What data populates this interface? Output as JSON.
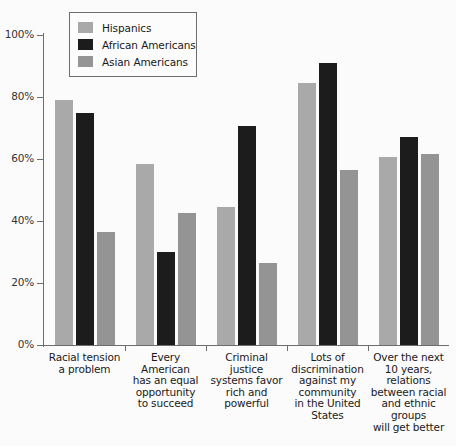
{
  "chart_data": {
    "type": "bar",
    "title": "",
    "xlabel": "",
    "ylabel": "",
    "ylim": [
      0,
      100
    ],
    "ytick_labels": [
      "0%",
      "20%",
      "40%",
      "60%",
      "80%",
      "100%"
    ],
    "ytick_values": [
      0,
      20,
      40,
      60,
      80,
      100
    ],
    "grid": false,
    "legend_position": "top-left-inside",
    "categories": [
      "Racial tension a problem",
      "Every American has an equal opportunity to succeed",
      "Criminal justice systems favor rich and powerful",
      "Lots of discrimination against my community in the United States",
      "Over the next 10 years, relations between racial and ethnic groups will get better"
    ],
    "category_lines": [
      [
        "Racial tension",
        "a problem"
      ],
      [
        "Every American",
        "has an equal",
        "opportunity",
        "to succeed"
      ],
      [
        "Criminal",
        "justice",
        "systems favor",
        "rich and",
        "powerful"
      ],
      [
        "Lots of",
        "discrimination",
        "against my",
        "community",
        "in the United",
        "States"
      ],
      [
        "Over the next",
        "10 years,",
        "relations",
        "between racial",
        "and ethnic",
        "groups",
        "will get better"
      ]
    ],
    "series": [
      {
        "name": "Hispanics",
        "color": "#a9a9a9",
        "values": [
          79,
          58.5,
          44.5,
          84.5,
          60.5
        ]
      },
      {
        "name": "African Americans",
        "color": "#1c1c1c",
        "values": [
          75,
          30,
          70.5,
          91,
          67
        ]
      },
      {
        "name": "Asian Americans",
        "color": "#949494",
        "values": [
          36.5,
          42.5,
          26.5,
          56.5,
          61.5
        ]
      }
    ]
  },
  "legend": {
    "items": [
      {
        "label": "Hispanics",
        "color": "#a9a9a9"
      },
      {
        "label": "African Americans",
        "color": "#1c1c1c"
      },
      {
        "label": "Asian Americans",
        "color": "#949494"
      }
    ]
  },
  "axis": {
    "y_ticks": [
      {
        "label": "100%",
        "value": 100
      },
      {
        "label": "80%",
        "value": 80
      },
      {
        "label": "60%",
        "value": 60
      },
      {
        "label": "40%",
        "value": 40
      },
      {
        "label": "20%",
        "value": 20
      },
      {
        "label": "0%",
        "value": 0
      }
    ]
  }
}
